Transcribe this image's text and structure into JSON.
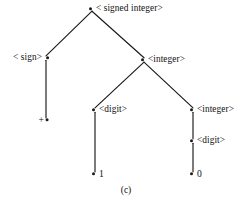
{
  "figure": {
    "caption": "(c)",
    "ink_color": "#1a1a1a",
    "background_color": "#ffffff"
  },
  "tree": {
    "nodes": [
      {
        "id": "root",
        "label": "< signed integer>",
        "x": 92,
        "y": 9,
        "label_side": "right",
        "kind": "nonterminal"
      },
      {
        "id": "sign",
        "label": "< sign>",
        "x": 46,
        "y": 58,
        "label_side": "left",
        "kind": "nonterminal"
      },
      {
        "id": "integer1",
        "label": "<integer>",
        "x": 144,
        "y": 60,
        "label_side": "right",
        "kind": "nonterminal"
      },
      {
        "id": "plus",
        "label": "+",
        "x": 46,
        "y": 120,
        "label_side": "left",
        "kind": "terminal"
      },
      {
        "id": "digit1",
        "label": "<digit>",
        "x": 95,
        "y": 110,
        "label_side": "right",
        "kind": "nonterminal"
      },
      {
        "id": "integer2",
        "label": "<integer>",
        "x": 193,
        "y": 110,
        "label_side": "right",
        "kind": "nonterminal"
      },
      {
        "id": "one",
        "label": "1",
        "x": 95,
        "y": 174,
        "label_side": "right",
        "kind": "terminal"
      },
      {
        "id": "digit2",
        "label": "<digit>",
        "x": 193,
        "y": 141,
        "label_side": "right",
        "kind": "nonterminal"
      },
      {
        "id": "zero",
        "label": "0",
        "x": 193,
        "y": 174,
        "label_side": "right",
        "kind": "terminal"
      }
    ],
    "edges": [
      {
        "from": "root",
        "to": "sign"
      },
      {
        "from": "root",
        "to": "integer1"
      },
      {
        "from": "sign",
        "to": "plus"
      },
      {
        "from": "integer1",
        "to": "digit1"
      },
      {
        "from": "integer1",
        "to": "integer2"
      },
      {
        "from": "digit1",
        "to": "one"
      },
      {
        "from": "integer2",
        "to": "digit2"
      },
      {
        "from": "digit2",
        "to": "zero"
      }
    ]
  }
}
